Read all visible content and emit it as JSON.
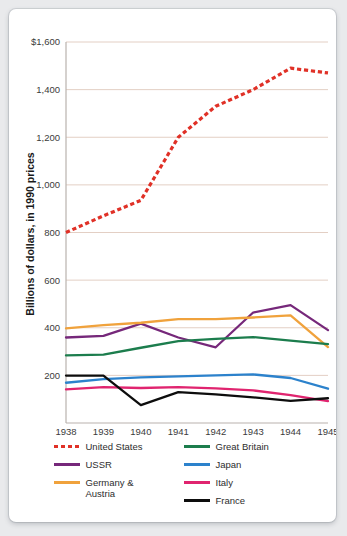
{
  "chart_data": {
    "type": "line",
    "title": "",
    "xlabel": "Year",
    "ylabel": "Billions of dollars, in 1990 prices",
    "x": [
      1938,
      1939,
      1940,
      1941,
      1942,
      1943,
      1944,
      1945
    ],
    "categories": [
      "1938",
      "1939",
      "1940",
      "1941",
      "1942",
      "1943",
      "1944",
      "1945"
    ],
    "xtick_labels": [
      "1938",
      "1939",
      "1940",
      "1941",
      "1942",
      "1943",
      "1944",
      "1945"
    ],
    "ytick_labels": [
      "$1,600",
      "1,400",
      "1,200",
      "1,000",
      "800",
      "600",
      "400",
      "200"
    ],
    "ytick_values": [
      1600,
      1400,
      1200,
      1000,
      800,
      600,
      400,
      200
    ],
    "ylim": [
      0,
      1600
    ],
    "xlim": [
      1938,
      1945
    ],
    "grid": "horizontal",
    "legend_position": "bottom",
    "series": [
      {
        "name": "United States",
        "color": "#e03127",
        "style": "dashed",
        "values": [
          800,
          870,
          935,
          1200,
          1330,
          1400,
          1490,
          1470
        ]
      },
      {
        "name": "USSR",
        "color": "#76287a",
        "style": "solid",
        "values": [
          359,
          366,
          417,
          359,
          318,
          464,
          495,
          390
        ]
      },
      {
        "name": "Germany &\nAustria",
        "color": "#f0a23c",
        "style": "solid",
        "values": [
          397,
          411,
          421,
          436,
          436,
          443,
          452,
          319
        ]
      },
      {
        "name": "Great Britain",
        "color": "#1c7d4d",
        "style": "solid",
        "values": [
          284,
          287,
          316,
          344,
          353,
          361,
          346,
          331
        ]
      },
      {
        "name": "Japan",
        "color": "#2c82cc",
        "style": "solid",
        "values": [
          169,
          184,
          192,
          196,
          200,
          204,
          189,
          144
        ]
      },
      {
        "name": "Italy",
        "color": "#e0246f",
        "style": "solid",
        "values": [
          141,
          151,
          147,
          151,
          145,
          137,
          117,
          92
        ]
      },
      {
        "name": "France",
        "color": "#0d0d0d",
        "style": "solid",
        "values": [
          199,
          199,
          75,
          130,
          120,
          108,
          93,
          104
        ]
      }
    ]
  },
  "legend": {
    "columns": [
      [
        {
          "label": "United States",
          "color": "#e03127",
          "style": "dashed",
          "name": "legend-united-states"
        },
        {
          "label": "USSR",
          "color": "#76287a",
          "style": "solid",
          "name": "legend-ussr"
        },
        {
          "label": "Germany &\nAustria",
          "color": "#f0a23c",
          "style": "solid",
          "name": "legend-germany-austria"
        }
      ],
      [
        {
          "label": "Great Britain",
          "color": "#1c7d4d",
          "style": "solid",
          "name": "legend-great-britain"
        },
        {
          "label": "Japan",
          "color": "#2c82cc",
          "style": "solid",
          "name": "legend-japan"
        },
        {
          "label": "Italy",
          "color": "#e0246f",
          "style": "solid",
          "name": "legend-italy"
        },
        {
          "label": "France",
          "color": "#0d0d0d",
          "style": "solid",
          "name": "legend-france"
        }
      ]
    ]
  },
  "colors": {
    "gridline": "#e3cfc4",
    "axis": "#b9b2ad",
    "card_background": "#ffffff",
    "page_background": "#e9eaec",
    "tick_text": "#3b3b3b",
    "title_text": "#1a1a1a"
  }
}
